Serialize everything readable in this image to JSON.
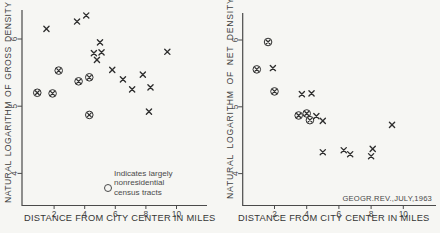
{
  "figure": {
    "source_note": "GEOGR.REV.,JULY,1963",
    "legend": {
      "symbol": "circle",
      "lines": [
        "Indicates largely",
        "nonresidential",
        "census tracts"
      ]
    },
    "colors": {
      "ink": "#2e2e2e",
      "axis": "#4a4a4a",
      "text": "#4a4a4a",
      "paper": "#f6f6f3"
    }
  },
  "chart_data": [
    {
      "type": "scatter",
      "title": "",
      "xlabel": "DISTANCE FROM CITY CENTER IN MILES",
      "ylabel": "NATURAL LOGARITHM OF GROSS DENSITY",
      "xlim": [
        0,
        12
      ],
      "ylim": [
        3.5,
        6.45
      ],
      "xticks": [
        2,
        4,
        6,
        8,
        10
      ],
      "yticks": [
        4,
        5,
        6
      ],
      "grid": false,
      "legend_position": "lower-center-inside",
      "series": [
        {
          "name": "residential census tracts",
          "marker": "x",
          "points": [
            [
              1.5,
              6.15
            ],
            [
              3.5,
              6.26
            ],
            [
              4.1,
              6.35
            ],
            [
              5.0,
              5.95
            ],
            [
              4.6,
              5.79
            ],
            [
              5.1,
              5.8
            ],
            [
              4.8,
              5.69
            ],
            [
              5.8,
              5.54
            ],
            [
              6.5,
              5.4
            ],
            [
              7.8,
              5.47
            ],
            [
              7.1,
              5.25
            ],
            [
              8.3,
              5.28
            ],
            [
              9.4,
              5.81
            ],
            [
              8.2,
              4.92
            ]
          ]
        },
        {
          "name": "largely nonresidential census tracts",
          "marker": "circled-x",
          "points": [
            [
              0.9,
              5.2
            ],
            [
              1.9,
              5.19
            ],
            [
              2.3,
              5.53
            ],
            [
              3.6,
              5.37
            ],
            [
              4.3,
              5.43
            ],
            [
              4.3,
              4.87
            ]
          ]
        }
      ]
    },
    {
      "type": "scatter",
      "title": "",
      "xlabel": "DISTANCE FROM CITY CENTER IN MILES",
      "ylabel": "NATURAL LOGARITHM OF NET DENSITY",
      "xlim": [
        0,
        12
      ],
      "ylim": [
        3.5,
        6.45
      ],
      "xticks": [
        2,
        4,
        6,
        8,
        10
      ],
      "yticks": [
        4,
        5,
        6
      ],
      "grid": false,
      "series": [
        {
          "name": "residential census tracts",
          "marker": "x",
          "points": [
            [
              1.9,
              5.58
            ],
            [
              3.7,
              5.19
            ],
            [
              4.3,
              5.2
            ],
            [
              4.6,
              4.86
            ],
            [
              5.0,
              4.79
            ],
            [
              5.0,
              4.32
            ],
            [
              6.3,
              4.35
            ],
            [
              6.7,
              4.29
            ],
            [
              8.1,
              4.37
            ],
            [
              8.0,
              4.26
            ],
            [
              9.3,
              4.73
            ]
          ]
        },
        {
          "name": "largely nonresidential census tracts",
          "marker": "circled-x",
          "points": [
            [
              1.6,
              5.97
            ],
            [
              0.9,
              5.56
            ],
            [
              2.0,
              5.23
            ],
            [
              3.5,
              4.87
            ],
            [
              4.0,
              4.9
            ],
            [
              4.2,
              4.8
            ]
          ]
        }
      ]
    }
  ]
}
